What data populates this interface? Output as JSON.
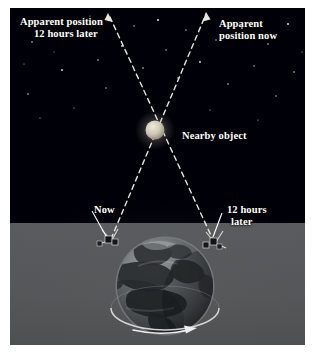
{
  "figure": {
    "background_color": "#000008",
    "haze_color": "#6d7070",
    "line_color": "#e8e6dc"
  },
  "labels": {
    "apparent_position_later": {
      "line1": "Apparent position",
      "line2": "12 hours later"
    },
    "apparent_position_now": {
      "line1": "Apparent",
      "line2": "position now"
    },
    "nearby_object": {
      "line1": "Nearby object"
    },
    "observer_now": {
      "line1": "Now"
    },
    "observer_later": {
      "line1": "12 hours",
      "line2": "later"
    }
  },
  "objects": {
    "nearby_object": {
      "name": "nearby-object-sphere",
      "cx": 145,
      "cy": 122,
      "r": 9,
      "color": "#cdc6b4"
    },
    "earth": {
      "name": "earth-globe",
      "cx": 155,
      "cy": 278,
      "r": 48,
      "ocean_color": "#5d6163",
      "land_color": "#2a2d2f"
    },
    "satellite_now": {
      "name": "satellite-now",
      "cx": 100,
      "cy": 232
    },
    "satellite_later": {
      "name": "satellite-12-hours-later",
      "cx": 203,
      "cy": 235
    },
    "rotation_arrow": {
      "name": "earth-rotation-arrow",
      "direction": "right"
    }
  },
  "sight_lines": [
    {
      "name": "sight-line-now",
      "from": "satellite-now",
      "through": "nearby-object",
      "to": "apparent-position-now",
      "style": "dashed",
      "arrow": "up-right"
    },
    {
      "name": "sight-line-later",
      "from": "satellite-12-hours-later",
      "through": "nearby-object",
      "to": "apparent-position-12-hours-later",
      "style": "dashed",
      "arrow": "up-left"
    }
  ],
  "stars": [
    {
      "x": 22,
      "y": 34,
      "r": 0.8
    },
    {
      "x": 37,
      "y": 14,
      "r": 0.7
    },
    {
      "x": 52,
      "y": 62,
      "r": 0.9
    },
    {
      "x": 18,
      "y": 86,
      "r": 0.8
    },
    {
      "x": 68,
      "y": 26,
      "r": 0.6
    },
    {
      "x": 88,
      "y": 52,
      "r": 0.8
    },
    {
      "x": 96,
      "y": 80,
      "r": 0.7
    },
    {
      "x": 112,
      "y": 38,
      "r": 0.9
    },
    {
      "x": 124,
      "y": 18,
      "r": 0.7
    },
    {
      "x": 133,
      "y": 60,
      "r": 0.8
    },
    {
      "x": 148,
      "y": 12,
      "r": 1.0
    },
    {
      "x": 156,
      "y": 42,
      "r": 0.7
    },
    {
      "x": 168,
      "y": 70,
      "r": 0.8
    },
    {
      "x": 176,
      "y": 22,
      "r": 0.7
    },
    {
      "x": 190,
      "y": 54,
      "r": 0.9
    },
    {
      "x": 206,
      "y": 32,
      "r": 0.7
    },
    {
      "x": 218,
      "y": 76,
      "r": 0.8
    },
    {
      "x": 232,
      "y": 20,
      "r": 0.9
    },
    {
      "x": 244,
      "y": 58,
      "r": 0.7
    },
    {
      "x": 258,
      "y": 36,
      "r": 0.8
    },
    {
      "x": 266,
      "y": 88,
      "r": 0.7
    },
    {
      "x": 278,
      "y": 16,
      "r": 0.9
    },
    {
      "x": 284,
      "y": 64,
      "r": 0.8
    },
    {
      "x": 30,
      "y": 110,
      "r": 0.6
    },
    {
      "x": 64,
      "y": 100,
      "r": 0.6
    },
    {
      "x": 200,
      "y": 102,
      "r": 0.6
    },
    {
      "x": 248,
      "y": 112,
      "r": 0.6
    },
    {
      "x": 80,
      "y": 8,
      "r": 0.6
    },
    {
      "x": 14,
      "y": 56,
      "r": 0.6
    },
    {
      "x": 292,
      "y": 44,
      "r": 0.6
    },
    {
      "x": 44,
      "y": 44,
      "r": 0.5
    },
    {
      "x": 212,
      "y": 14,
      "r": 0.5
    }
  ]
}
